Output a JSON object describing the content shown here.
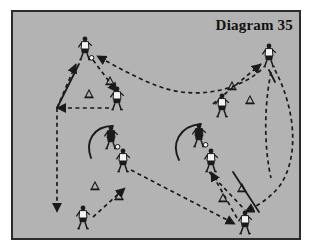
{
  "diagram": {
    "title": "Diagram 35",
    "domain_note": "soccer coaching drill diagram",
    "background_color": "#b3b3b3",
    "border_color": "#2b2b2b",
    "page_color": "#ffffff",
    "ink_color": "#1a1a1a",
    "frame": {
      "x": 11,
      "y": 10,
      "width": 290,
      "height": 230
    }
  },
  "legend": {
    "player_light_label": "player-light-kit",
    "player_dark_label": "player-dark-kit-with-ball",
    "cone_label": "training-cone",
    "dashed_label": "pass-or-movement-path-dashed",
    "solid_label": "run-path-solid",
    "arc_label": "turn-arc-solid"
  },
  "players": [
    {
      "id": "p1",
      "name": "player-top-left",
      "x": 72,
      "y": 38,
      "kit": "light",
      "has_ball": true
    },
    {
      "id": "p2",
      "name": "player-upper-left-mid",
      "x": 104,
      "y": 88,
      "kit": "light",
      "has_ball": false
    },
    {
      "id": "p3",
      "name": "player-center-left-ball",
      "x": 98,
      "y": 127,
      "kit": "dark",
      "has_ball": true
    },
    {
      "id": "p4",
      "name": "player-center-left-low",
      "x": 110,
      "y": 150,
      "kit": "light",
      "has_ball": false
    },
    {
      "id": "p5",
      "name": "player-bottom-left",
      "x": 70,
      "y": 207,
      "kit": "light",
      "has_ball": false
    },
    {
      "id": "p6",
      "name": "player-center-right-ball",
      "x": 186,
      "y": 125,
      "kit": "dark",
      "has_ball": true
    },
    {
      "id": "p7",
      "name": "player-center-right-low",
      "x": 198,
      "y": 150,
      "kit": "light",
      "has_ball": false
    },
    {
      "id": "p8",
      "name": "player-upper-right-mid",
      "x": 209,
      "y": 95,
      "kit": "light",
      "has_ball": false
    },
    {
      "id": "p9",
      "name": "player-top-right",
      "x": 256,
      "y": 45,
      "kit": "light",
      "has_ball": false
    },
    {
      "id": "p10",
      "name": "player-bottom-right",
      "x": 232,
      "y": 212,
      "kit": "light",
      "has_ball": false
    }
  ],
  "cones": [
    {
      "id": "c1",
      "name": "cone-upper-left-a",
      "x": 97,
      "y": 70
    },
    {
      "id": "c2",
      "name": "cone-upper-left-b",
      "x": 76,
      "y": 83
    },
    {
      "id": "c3",
      "name": "cone-upper-right-a",
      "x": 219,
      "y": 75
    },
    {
      "id": "c4",
      "name": "cone-upper-right-b",
      "x": 237,
      "y": 89
    },
    {
      "id": "c5",
      "name": "cone-lower-left-a",
      "x": 82,
      "y": 175
    },
    {
      "id": "c6",
      "name": "cone-lower-left-b",
      "x": 106,
      "y": 185
    },
    {
      "id": "c7",
      "name": "cone-lower-right-a",
      "x": 210,
      "y": 187
    },
    {
      "id": "c8",
      "name": "cone-lower-right-b",
      "x": 229,
      "y": 177
    }
  ],
  "paths": {
    "dashed": [
      {
        "id": "d1",
        "name": "path-top-long-curve-right-to-left",
        "d": "M 248 58 C 230 74 200 84 168 80 C 140 76 110 58 84 44",
        "arrow": "end"
      },
      {
        "id": "d2",
        "name": "path-top-left-down-to-mid",
        "d": "M 80 48 L 104 80",
        "arrow": "end"
      },
      {
        "id": "d3",
        "name": "path-mid-left-to-left-wall",
        "d": "M 96 96 L 44 96",
        "arrow": "end"
      },
      {
        "id": "d4",
        "name": "path-left-wall-vertical-down",
        "d": "M 44 96 L 44 200",
        "arrow": "end"
      },
      {
        "id": "d5",
        "name": "path-left-wall-up-to-top-player",
        "d": "M 44 96 L 63 52",
        "arrow": "end"
      },
      {
        "id": "d6",
        "name": "path-bottom-left-up-to-cone",
        "d": "M 80 205 L 112 176",
        "arrow": "end"
      },
      {
        "id": "d7",
        "name": "path-center-left-down-right-long",
        "d": "M 118 158 L 222 212",
        "arrow": "end"
      },
      {
        "id": "d8",
        "name": "path-lower-right-up-to-player",
        "d": "M 224 206 L 198 160",
        "arrow": "end"
      },
      {
        "id": "d9",
        "name": "path-mid-right-up-to-top-right",
        "d": "M 200 92 L 248 52",
        "arrow": "end"
      },
      {
        "id": "d10",
        "name": "path-right-long-curve-down",
        "d": "M 262 58 C 280 92 288 140 268 172 C 258 186 244 194 232 200",
        "arrow": "end"
      },
      {
        "id": "d11",
        "name": "path-right-inner-curve-down",
        "d": "M 258 60 C 250 100 252 140 258 166",
        "arrow": "none"
      },
      {
        "id": "d12",
        "name": "path-center-right-to-bottom-right",
        "d": "M 196 160 L 232 198",
        "arrow": "none"
      }
    ],
    "solid": [
      {
        "id": "s1",
        "name": "run-top-left-down-left",
        "d": "M 66 52 L 44 96"
      },
      {
        "id": "s2",
        "name": "run-bottom-right-up",
        "d": "M 246 200 L 220 160"
      },
      {
        "id": "s3",
        "name": "run-top-right-short",
        "d": "M 256 58 L 262 70"
      }
    ],
    "arcs": [
      {
        "id": "a1",
        "name": "turn-arc-left",
        "d": "M 100 114 C 80 114 72 130 78 146"
      },
      {
        "id": "a2",
        "name": "turn-arc-right",
        "d": "M 188 112 C 166 114 158 132 166 148"
      }
    ]
  }
}
